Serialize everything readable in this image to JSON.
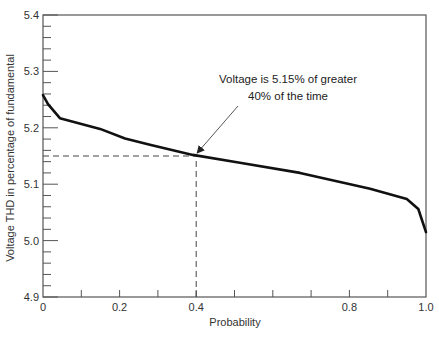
{
  "chart_data": {
    "type": "line",
    "title": "",
    "xlabel": "Probability",
    "ylabel": "Voltage THD in percentage of fundamental",
    "xlim": [
      0,
      1.0
    ],
    "ylim": [
      4.9,
      5.4
    ],
    "grid": false,
    "legend": null,
    "x_ticks": [
      0,
      0.1,
      0.2,
      0.3,
      0.4,
      0.5,
      0.6,
      0.7,
      0.8,
      0.9,
      1.0
    ],
    "x_tick_labels": [
      {
        "value": 0,
        "label": "0"
      },
      {
        "value": 0.2,
        "label": "0.2"
      },
      {
        "value": 0.4,
        "label": "0.4"
      },
      {
        "value": 0.8,
        "label": "0.8"
      },
      {
        "value": 1.0,
        "label": "1.0"
      }
    ],
    "y_major_ticks": [
      4.9,
      5.0,
      5.1,
      5.2,
      5.3,
      5.4
    ],
    "y_tick_labels": [
      {
        "value": 4.9,
        "label": "4.9"
      },
      {
        "value": 5.0,
        "label": "5.0"
      },
      {
        "value": 5.1,
        "label": "5.1"
      },
      {
        "value": 5.2,
        "label": "5.2"
      },
      {
        "value": 5.3,
        "label": "5.3"
      },
      {
        "value": 5.4,
        "label": "5.4"
      }
    ],
    "y_minor_step": 0.02,
    "series": [
      {
        "name": "Voltage THD",
        "x": [
          0.0,
          0.013,
          0.044,
          0.149,
          0.214,
          0.279,
          0.391,
          0.514,
          0.671,
          0.854,
          0.95,
          0.98,
          1.0
        ],
        "values": [
          5.258,
          5.242,
          5.217,
          5.198,
          5.181,
          5.17,
          5.152,
          5.138,
          5.12,
          5.092,
          5.074,
          5.056,
          5.015
        ]
      }
    ],
    "annotations": [
      {
        "text_lines": [
          "Voltage is 5.15% of greater",
          "40% of the time"
        ],
        "arrow_to": {
          "x": 0.4,
          "y": 5.15
        }
      }
    ],
    "reference_lines": [
      {
        "type": "horizontal",
        "y": 5.15,
        "x_from": 0,
        "x_to": 0.4,
        "style": "dashed"
      },
      {
        "type": "vertical",
        "x": 0.4,
        "y_from": 4.9,
        "y_to": 5.15,
        "style": "dashed"
      }
    ]
  },
  "labels": {
    "xlabel": "Probability",
    "ylabel": "Voltage THD in percentage of fundamental",
    "annotation_line1": "Voltage is 5.15% of greater",
    "annotation_line2": "40% of the time"
  }
}
